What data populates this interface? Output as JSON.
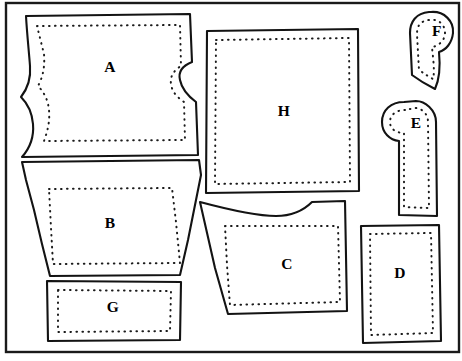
{
  "document": {
    "title": "Garment Pattern Piece Layout",
    "type": "sewing-pattern-diagram",
    "canvas": {
      "width": 462,
      "height": 361
    },
    "colors": {
      "background": "#ffffff",
      "outline": "#131313",
      "seam_line": "#1b1b1b",
      "frame": "#1a1a1a",
      "label_text": "#000000"
    }
  },
  "frame": {
    "name": "diagram-border",
    "x": 6,
    "y": 3,
    "width": 453,
    "height": 349
  },
  "pieces": [
    {
      "id": "A",
      "label": "A",
      "name": "pattern-piece-a",
      "shape": "waisted-bodice-front",
      "label_x": 110,
      "label_y": 68,
      "outline": "M 26 16 L 190 14 L 192 62 C 182 66 178 72 180 80 C 182 90 188 96 196 102 L 198 155 L 22 157 C 30 148 34 136 33 124 C 32 112 28 104 21 97 C 28 88 31 78 30 66 C 29 52 27 34 26 16 Z",
      "seam": "M 37 26 L 180 25 L 181 66 C 173 71 170 77 171 84 C 172 92 177 97 184 102 L 185 140 L 44 141 C 48 130 50 120 49 110 C 48 100 44 92 38 86 C 43 77 45 66 44 54 Z"
    },
    {
      "id": "B",
      "label": "B",
      "name": "pattern-piece-b",
      "shape": "tapered-trapezoid-skirt",
      "label_x": 110,
      "label_y": 224,
      "outline": "M 22 162 L 199 160 L 201 175 L 196 200 L 188 240 L 180 275 L 50 276 L 42 244 L 34 210 L 26 180 Z",
      "seam": "M 49 189 L 172 188 L 176 222 L 180 263 L 53 264 L 51 228 Z"
    },
    {
      "id": "C",
      "label": "C",
      "name": "pattern-piece-c",
      "shape": "notched-top-panel",
      "label_x": 287,
      "label_y": 265,
      "outline": "M 200 202 C 230 210 260 216 276 216 C 292 216 304 210 312 202 L 345 201 L 347 311 L 228 314 L 215 268 Z",
      "seam": "M 225 226 L 338 226 L 340 302 L 230 305 L 227 265 Z"
    },
    {
      "id": "D",
      "label": "D",
      "name": "pattern-piece-d",
      "shape": "rectangle-panel",
      "label_x": 400,
      "label_y": 274,
      "outline": "M 361 226 L 439 225 L 441 341 L 363 343 Z",
      "seam": "M 370 234 L 431 233 L 433 333 L 371 335 Z"
    },
    {
      "id": "E",
      "label": "E",
      "name": "pattern-piece-e",
      "shape": "rounded-head-strap",
      "label_x": 416,
      "label_y": 124,
      "outline": "M 404 102 C 391 102 382 110 382 122 C 382 133 390 140 399 141 L 399 215 L 437 216 L 436 122 C 436 110 425 101 416 101 Z",
      "seam": "M 405 110 C 396 110 390 115 390 122 C 390 129 396 133 404 133 L 404 207 L 429 208 L 428 122 C 428 113 421 108 415 108 Z"
    },
    {
      "id": "F",
      "label": "F",
      "name": "pattern-piece-f",
      "shape": "rounded-head-tail",
      "label_x": 437,
      "label_y": 32,
      "outline": "M 429 12 C 416 13 410 22 410 33 L 412 75 C 420 81 427 85 435 89 C 440 78 440 62 439 52 C 446 50 452 43 453 33 C 454 21 444 11 431 12 Z",
      "seam": "M 429 20 C 420 21 417 26 417 34 L 419 70 C 425 74 429 77 433 79 C 435 71 433 58 432 47 C 439 46 445 40 445 33 C 445 24 438 19 431 20 Z"
    },
    {
      "id": "G",
      "label": "G",
      "name": "pattern-piece-g",
      "shape": "rectangle-waistband",
      "label_x": 113,
      "label_y": 308,
      "outline": "M 47 281 L 181 282 L 180 340 L 48 341 Z",
      "seam": "M 58 290 L 171 291 L 170 331 L 58 332 Z"
    },
    {
      "id": "H",
      "label": "H",
      "name": "pattern-piece-h",
      "shape": "large-square-panel",
      "label_x": 284,
      "label_y": 112,
      "outline": "M 207 31 L 358 29 L 359 191 L 206 193 Z",
      "seam": "M 216 40 L 349 38 L 350 182 L 215 184 Z"
    }
  ]
}
